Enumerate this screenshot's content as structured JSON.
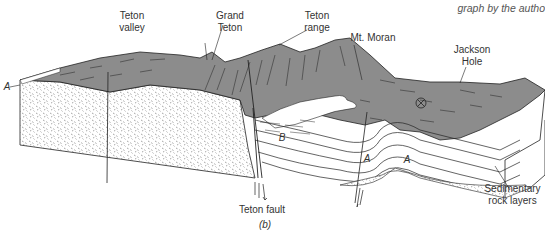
{
  "caption": "graph by the autho",
  "figure_label": "(b)",
  "labels": {
    "teton_valley": [
      "Teton",
      "valley"
    ],
    "grand_teton": [
      "Grand",
      "Teton"
    ],
    "teton_range": [
      "Teton",
      "range"
    ],
    "mt_moran": "Mt. Moran",
    "jackson_hole": [
      "Jackson",
      "Hole"
    ],
    "teton_fault": "Teton fault",
    "sedimentary": [
      "Sedimentary",
      "rock layers"
    ],
    "layer_a_left": "A",
    "layer_a_mid1": "A",
    "layer_a_mid2": "A",
    "layer_b": "B"
  },
  "colors": {
    "surface": "#8c8c8c",
    "line": "#222222",
    "stipple": "#555555",
    "background": "#ffffff"
  }
}
